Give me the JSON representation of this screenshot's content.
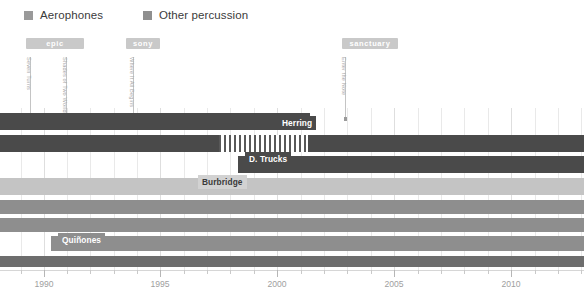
{
  "legend": {
    "items": [
      {
        "label": "Aerophones",
        "color": "#9a9a9a",
        "icon": "square-swatch-icon"
      },
      {
        "label": "Other percussion",
        "color": "#8f8f8f",
        "icon": "square-swatch-icon"
      }
    ]
  },
  "publisher_pills": [
    {
      "label": "epic",
      "x": 26,
      "width": 58,
      "color": "#c9c9c9"
    },
    {
      "label": "sony",
      "x": 126,
      "width": 34,
      "color": "#c9c9c9"
    },
    {
      "label": "sanctuary",
      "x": 342,
      "width": 56,
      "color": "#c9c9c9"
    }
  ],
  "release_annotations": [
    {
      "label": "Seven Turns",
      "x": 30,
      "top": 57,
      "line_height": 62
    },
    {
      "label": "Shades of Two Worlds",
      "x": 66,
      "top": 57,
      "line_height": 62
    },
    {
      "label": "Where It All Begins",
      "x": 133,
      "top": 57,
      "line_height": 62
    },
    {
      "label": "Enter the Note",
      "x": 345,
      "top": 57,
      "line_height": 62
    }
  ],
  "bar_labels": [
    {
      "text": "Herring",
      "x": 278,
      "y": 116,
      "bg": "#4a4a4a",
      "color": "#ffffff"
    },
    {
      "text": "D. Trucks",
      "x": 245,
      "y": 152,
      "bg": "#4a4a4a",
      "color": "#ffffff"
    },
    {
      "text": "Burbridge",
      "x": 198,
      "y": 175,
      "bg": "#d2d2d2",
      "color": "#3a3a3a"
    },
    {
      "text": "Quiñones",
      "x": 58,
      "y": 233,
      "bg": "#8e8e8e",
      "color": "#ffffff"
    }
  ],
  "axis": {
    "major_ticks": [
      {
        "value": "1990",
        "x": 44
      },
      {
        "value": "1995",
        "x": 160
      },
      {
        "value": "2000",
        "x": 277
      },
      {
        "value": "2005",
        "x": 394
      },
      {
        "value": "2010",
        "x": 511
      }
    ],
    "minor_tick_x": [
      21,
      67,
      90,
      114,
      137,
      184,
      207,
      230,
      254,
      301,
      324,
      347,
      371,
      418,
      441,
      464,
      488,
      535,
      558,
      581
    ]
  },
  "chart_data": {
    "type": "bar",
    "title": "",
    "xlabel": "",
    "ylabel": "",
    "xlim": [
      1989,
      2012.5
    ],
    "grid": true,
    "legend_position": "top-left",
    "categories": [
      "Herring",
      "Aerophones track",
      "D. Trucks",
      "Burbridge",
      "Percussion A",
      "Percussion B",
      "Quiñones",
      "Baseline"
    ],
    "series": [
      {
        "name": "Herring",
        "row": 0,
        "top": 5,
        "height": 17,
        "segments": [
          {
            "start": 0,
            "end": 310,
            "color": "#4a4a4a",
            "style": "solid"
          }
        ]
      },
      {
        "name": "Aerophones track",
        "row": 1,
        "top": 27,
        "height": 17,
        "segments": [
          {
            "start": 0,
            "end": 219,
            "color": "#4a4a4a",
            "style": "solid"
          },
          {
            "start": 219,
            "end": 308,
            "color": "#585858",
            "style": "hatch"
          },
          {
            "start": 308,
            "end": 584,
            "color": "#4a4a4a",
            "style": "solid"
          }
        ]
      },
      {
        "name": "D. Trucks",
        "row": 2,
        "top": 48,
        "height": 17,
        "segments": [
          {
            "start": 238,
            "end": 584,
            "color": "#4a4a4a",
            "style": "solid"
          }
        ]
      },
      {
        "name": "Burbridge",
        "row": 3,
        "top": 70,
        "height": 17,
        "segments": [
          {
            "start": 0,
            "end": 584,
            "color": "#c4c4c4",
            "style": "solid"
          }
        ]
      },
      {
        "name": "Percussion A",
        "row": 4,
        "top": 92,
        "height": 14,
        "segments": [
          {
            "start": 0,
            "end": 584,
            "color": "#8e8e8e",
            "style": "solid"
          }
        ]
      },
      {
        "name": "Percussion B",
        "row": 5,
        "top": 110,
        "height": 14,
        "segments": [
          {
            "start": 0,
            "end": 584,
            "color": "#8e8e8e",
            "style": "solid"
          }
        ]
      },
      {
        "name": "Quiñones",
        "row": 6,
        "top": 128,
        "height": 15,
        "segments": [
          {
            "start": 51,
            "end": 584,
            "color": "#8e8e8e",
            "style": "solid"
          }
        ]
      },
      {
        "name": "Baseline",
        "row": 7,
        "top": 148,
        "height": 11,
        "segments": [
          {
            "start": 0,
            "end": 584,
            "color": "#6d6d6d",
            "style": "solid"
          }
        ]
      }
    ],
    "gridline_x": [
      21,
      44,
      67,
      90,
      114,
      137,
      160,
      184,
      207,
      230,
      254,
      277,
      301,
      324,
      347,
      371,
      394,
      418,
      441,
      464,
      488,
      511,
      535,
      558,
      581
    ],
    "major_gridline_x": [
      44,
      160,
      277,
      394,
      511
    ]
  }
}
